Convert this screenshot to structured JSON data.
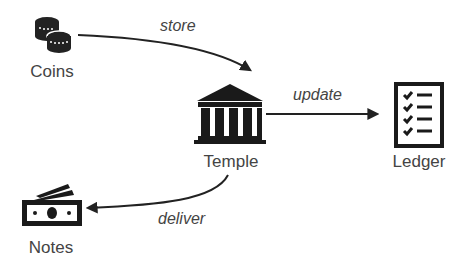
{
  "nodes": {
    "coins": {
      "label": "Coins",
      "icon": "coins-icon"
    },
    "temple": {
      "label": "Temple",
      "icon": "temple-icon"
    },
    "ledger": {
      "label": "Ledger",
      "icon": "checklist-icon"
    },
    "notes": {
      "label": "Notes",
      "icon": "banknotes-icon"
    }
  },
  "edges": [
    {
      "from": "Coins",
      "to": "Temple",
      "label": "store"
    },
    {
      "from": "Temple",
      "to": "Ledger",
      "label": "update"
    },
    {
      "from": "Temple",
      "to": "Notes",
      "label": "deliver"
    }
  ]
}
